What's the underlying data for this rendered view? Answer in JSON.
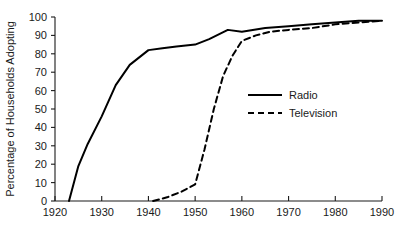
{
  "chart_data": {
    "type": "line",
    "title": "",
    "subtitle": "",
    "xlabel": "",
    "ylabel": "Percentage of Households Adopting",
    "xlim": [
      1920,
      1990
    ],
    "ylim": [
      0,
      100
    ],
    "grid": false,
    "legend_position": "center-right",
    "x_ticks": [
      1920,
      1930,
      1940,
      1950,
      1960,
      1970,
      1980,
      1990
    ],
    "x_tick_labels": [
      "1920",
      "1930",
      "1940",
      "1950",
      "1960",
      "1970",
      "1980",
      "1990"
    ],
    "y_ticks": [
      0,
      10,
      20,
      30,
      40,
      50,
      60,
      70,
      80,
      90,
      100
    ],
    "y_tick_labels": [
      "0",
      "10",
      "20",
      "30",
      "40",
      "50",
      "60",
      "70",
      "80",
      "90",
      "100"
    ],
    "series": [
      {
        "name": "Radio",
        "style": "solid",
        "color": "#000000",
        "x": [
          1923,
          1925,
          1927,
          1930,
          1933,
          1936,
          1940,
          1943,
          1946,
          1950,
          1953,
          1957,
          1960,
          1965,
          1970,
          1975,
          1980,
          1985,
          1990
        ],
        "values": [
          0,
          19,
          31,
          46,
          63,
          74,
          82,
          83,
          84,
          85,
          88,
          93,
          92,
          94,
          95,
          96,
          97,
          98,
          98
        ]
      },
      {
        "name": "Television",
        "style": "dashed",
        "color": "#000000",
        "x": [
          1941,
          1944,
          1947,
          1950,
          1952,
          1954,
          1956,
          1958,
          1960,
          1963,
          1966,
          1970,
          1975,
          1980,
          1985,
          1990
        ],
        "values": [
          0,
          2,
          5,
          9,
          28,
          50,
          68,
          79,
          87,
          90,
          92,
          93,
          94,
          96,
          97,
          98
        ]
      }
    ],
    "legend": [
      {
        "label": "Radio",
        "style": "solid"
      },
      {
        "label": "Television",
        "style": "dashed"
      }
    ],
    "annotations": []
  },
  "geometry": {
    "plot_left": 55,
    "plot_right": 382,
    "plot_top": 17,
    "plot_bottom": 201,
    "legend_x": 248,
    "legend_y_radio": 95,
    "legend_y_television": 113
  }
}
